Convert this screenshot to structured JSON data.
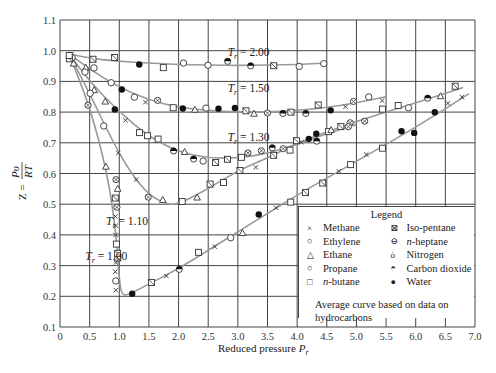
{
  "chart_data": {
    "type": "scatter",
    "title": "",
    "xlabel": "Reduced pressure P_r",
    "ylabel": "Z = Pv/RT",
    "xlim": [
      0,
      7.0
    ],
    "ylim": [
      0.1,
      1.1
    ],
    "grid": true,
    "xticks": [
      "0",
      "0.5",
      "1.0",
      "1.5",
      "2.0",
      "2.5",
      "3.0",
      "3.5",
      "4.0",
      "4.5",
      "5.0",
      "5.5",
      "6.0",
      "6.5",
      "7.0"
    ],
    "yticks": [
      "0.1",
      "0.2",
      "0.3",
      "0.4",
      "0.5",
      "0.6",
      "0.7",
      "0.8",
      "0.9",
      "1.0",
      "1.1"
    ],
    "legend_position": "lower right",
    "curves": [
      {
        "name": "T_r = 2.00",
        "label_at": [
          3.3,
          0.995
        ],
        "x": [
          0.15,
          0.5,
          1.0,
          1.5,
          2.0,
          2.5,
          3.0,
          3.5,
          4.0,
          4.5
        ],
        "y": [
          0.99,
          0.975,
          0.965,
          0.96,
          0.955,
          0.953,
          0.952,
          0.953,
          0.955,
          0.96
        ]
      },
      {
        "name": "T_r = 1.50",
        "label_at": [
          3.3,
          0.88
        ],
        "x": [
          0.15,
          0.5,
          1.0,
          1.5,
          2.0,
          2.5,
          3.0,
          3.5,
          4.0,
          4.5,
          5.0,
          5.5
        ],
        "y": [
          0.99,
          0.94,
          0.88,
          0.84,
          0.815,
          0.805,
          0.8,
          0.8,
          0.805,
          0.815,
          0.83,
          0.85
        ]
      },
      {
        "name": "T_r = 1.30",
        "label_at": [
          3.3,
          0.72
        ],
        "x": [
          0.15,
          0.5,
          1.0,
          1.5,
          2.0,
          2.5,
          3.0,
          3.5,
          4.0,
          4.5,
          5.0
        ],
        "y": [
          0.99,
          0.9,
          0.8,
          0.72,
          0.67,
          0.65,
          0.65,
          0.665,
          0.695,
          0.73,
          0.76
        ]
      },
      {
        "name": "T_r = 1.10",
        "label_at": [
          1.25,
          0.445
        ],
        "x": [
          0.15,
          0.5,
          0.9,
          1.2,
          1.5,
          1.8,
          2.0,
          2.5,
          3.0,
          3.5,
          4.0,
          5.0,
          6.0,
          6.8
        ],
        "y": [
          0.99,
          0.86,
          0.7,
          0.6,
          0.53,
          0.5,
          0.5,
          0.55,
          0.61,
          0.65,
          0.7,
          0.77,
          0.83,
          0.88
        ]
      },
      {
        "name": "T_r = 1.00",
        "label_at": [
          0.9,
          0.33
        ],
        "x": [
          0.15,
          0.5,
          0.8,
          0.95,
          1.0,
          1.05,
          1.2,
          1.5,
          2.0,
          2.5,
          3.0,
          3.5,
          4.0,
          5.0,
          6.0,
          6.9
        ],
        "y": [
          0.99,
          0.82,
          0.6,
          0.4,
          0.25,
          0.2,
          0.21,
          0.24,
          0.29,
          0.35,
          0.41,
          0.47,
          0.53,
          0.64,
          0.75,
          0.86
        ]
      }
    ],
    "series": [
      {
        "name": "Methane",
        "marker": "x"
      },
      {
        "name": "Ethylene",
        "marker": "open-circle"
      },
      {
        "name": "Ethane",
        "marker": "triangle"
      },
      {
        "name": "Propane",
        "marker": "open-circle"
      },
      {
        "name": "n-butane",
        "marker": "square"
      },
      {
        "name": "Iso-pentane",
        "marker": "crossed-square"
      },
      {
        "name": "n-heptane",
        "marker": "barred-circle"
      },
      {
        "name": "Nitrogen",
        "marker": "tailed-circle"
      },
      {
        "name": "Carbon dioxide",
        "marker": "half-filled-circle"
      },
      {
        "name": "Water",
        "marker": "filled-circle"
      }
    ],
    "annotation": "Average curve based on data on hydrocarbons"
  },
  "axes": {
    "xlabel_text": "Reduced pressure ",
    "xlabel_sub": "P",
    "xlabel_subscript": "r",
    "ylabel_z": "Z =",
    "ylabel_num": "Pυ",
    "ylabel_den": "RT"
  },
  "legend": {
    "title": "Legend",
    "left": [
      {
        "symbol": "×",
        "label": "Methane"
      },
      {
        "symbol": "○",
        "label": "Ethylene"
      },
      {
        "symbol": "△",
        "label": "Ethane"
      },
      {
        "symbol": "○",
        "label": "Propane"
      },
      {
        "symbol": "□",
        "label": "n-butane"
      }
    ],
    "right": [
      {
        "symbol": "⊠",
        "label": "Iso-pentane"
      },
      {
        "symbol": "⊖",
        "label": "n-heptane"
      },
      {
        "symbol": "ȯ",
        "label": "Nitrogen"
      },
      {
        "symbol": "◓",
        "label": "Carbon dioxide"
      },
      {
        "symbol": "●",
        "label": "Water"
      }
    ],
    "note": "Average curve based on data on hydrocarbons"
  },
  "colors": {
    "grid": "#444444",
    "curve": "#999999",
    "marker": "#333333"
  }
}
